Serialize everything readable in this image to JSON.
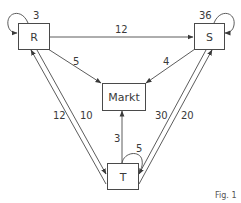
{
  "diagram": {
    "nodes": [
      {
        "id": "R",
        "label": "R"
      },
      {
        "id": "S",
        "label": "S"
      },
      {
        "id": "Markt",
        "label": "Markt"
      },
      {
        "id": "T",
        "label": "T"
      }
    ],
    "edges": [
      {
        "from": "R",
        "to": "R",
        "label": "3"
      },
      {
        "from": "S",
        "to": "S",
        "label": "36"
      },
      {
        "from": "T",
        "to": "T",
        "label": "5"
      },
      {
        "from": "R",
        "to": "S",
        "label": "12"
      },
      {
        "from": "R",
        "to": "Markt",
        "label": "5"
      },
      {
        "from": "S",
        "to": "Markt",
        "label": "4"
      },
      {
        "from": "T",
        "to": "Markt",
        "label": "3"
      },
      {
        "from": "T",
        "to": "R",
        "label": "12"
      },
      {
        "from": "R",
        "to": "T",
        "label": "10"
      },
      {
        "from": "S",
        "to": "T",
        "label": "30"
      },
      {
        "from": "T",
        "to": "S",
        "label": "20"
      }
    ],
    "caption": "Fig. 1"
  }
}
